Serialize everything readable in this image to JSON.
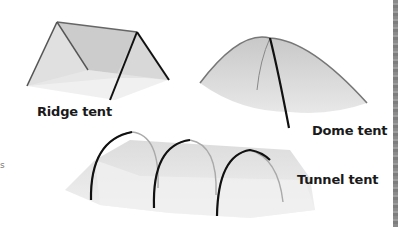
{
  "diagram": {
    "tents": [
      {
        "name": "Ridge tent",
        "label_position": "below-left"
      },
      {
        "name": "Dome tent",
        "label_position": "below-right"
      },
      {
        "name": "Tunnel tent",
        "label_position": "right"
      }
    ],
    "edge_fragments": [
      "s"
    ],
    "colors": {
      "pole": "#111111",
      "fabric_light": "#e6e6e6",
      "fabric_mid": "#cfcfcf",
      "fabric_dark": "#bdbdbd",
      "page_border": "#8a8a8a"
    }
  }
}
